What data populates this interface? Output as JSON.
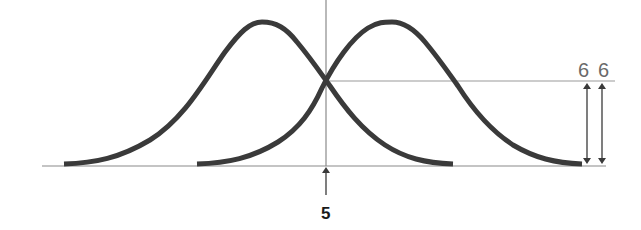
{
  "diagram": {
    "type": "two overlapping bell curves",
    "colors": {
      "curve": "#3a3a3a",
      "axis": "#8a8a8a",
      "arrow": "#3a3a3a",
      "label_6": "#6a6a6a",
      "label_5": "#1a1a1a"
    },
    "curves": [
      {
        "name": "left-curve",
        "start_x": 64,
        "peak_x": 262,
        "end_x": 453
      },
      {
        "name": "right-curve",
        "start_x": 197,
        "peak_x": 390,
        "end_x": 582
      }
    ],
    "intersection_marker_label": "5",
    "height_labels": [
      "6",
      "6"
    ]
  }
}
